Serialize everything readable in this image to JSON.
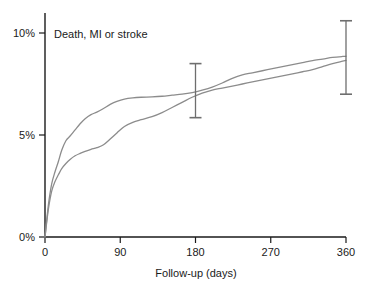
{
  "chart_data": {
    "type": "line",
    "title": "",
    "annotation": "Death, MI or stroke",
    "xlabel": "Follow-up (days)",
    "ylabel": "",
    "xlim": [
      0,
      360
    ],
    "ylim": [
      0,
      10.8
    ],
    "grid": false,
    "legend_position": "none",
    "x_ticks": [
      0,
      90,
      180,
      270,
      360
    ],
    "x_tick_labels": [
      "0",
      "90",
      "180",
      "270",
      "360"
    ],
    "y_ticks": [
      0,
      5,
      10
    ],
    "y_tick_labels": [
      "0%",
      "5%",
      "10%"
    ],
    "curve_color": "#8c8c8c",
    "axis_color": "#1a1a1a",
    "errorbar_color": "#6e6e6e",
    "series": [
      {
        "name": "upper-curve",
        "x": [
          0,
          4,
          8,
          12,
          16,
          20,
          25,
          30,
          36,
          42,
          48,
          55,
          62,
          70,
          78,
          86,
          95,
          105,
          115,
          128,
          140,
          152,
          164,
          176,
          188,
          200,
          212,
          224,
          236,
          248,
          260,
          272,
          284,
          296,
          308,
          320,
          332,
          344,
          356,
          360
        ],
        "values": [
          0.0,
          1.55,
          2.6,
          3.2,
          3.7,
          4.25,
          4.72,
          4.95,
          5.25,
          5.55,
          5.8,
          6.0,
          6.12,
          6.3,
          6.5,
          6.65,
          6.76,
          6.82,
          6.85,
          6.87,
          6.9,
          6.95,
          7.0,
          7.08,
          7.2,
          7.35,
          7.55,
          7.78,
          7.95,
          8.05,
          8.15,
          8.25,
          8.35,
          8.45,
          8.55,
          8.65,
          8.72,
          8.8,
          8.85,
          8.86
        ]
      },
      {
        "name": "lower-curve",
        "x": [
          0,
          4,
          8,
          12,
          16,
          20,
          25,
          30,
          36,
          42,
          48,
          55,
          62,
          70,
          78,
          86,
          95,
          105,
          115,
          128,
          140,
          152,
          164,
          176,
          188,
          200,
          212,
          224,
          236,
          248,
          260,
          272,
          284,
          296,
          308,
          320,
          332,
          344,
          356,
          360
        ],
        "values": [
          0.0,
          1.35,
          2.25,
          2.72,
          3.05,
          3.35,
          3.6,
          3.8,
          3.98,
          4.1,
          4.2,
          4.3,
          4.38,
          4.52,
          4.8,
          5.1,
          5.42,
          5.62,
          5.75,
          5.9,
          6.1,
          6.35,
          6.6,
          6.85,
          7.05,
          7.2,
          7.3,
          7.4,
          7.5,
          7.6,
          7.7,
          7.8,
          7.9,
          8.0,
          8.1,
          8.2,
          8.35,
          8.5,
          8.62,
          8.66
        ]
      }
    ],
    "error_bars": [
      {
        "name": "errorbar-180",
        "x": 180,
        "center": 7.1,
        "low": 5.85,
        "high": 8.5
      },
      {
        "name": "errorbar-360",
        "x": 360,
        "center": 8.8,
        "low": 7.0,
        "high": 10.6
      }
    ]
  }
}
